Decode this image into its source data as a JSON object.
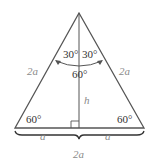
{
  "figure": {
    "type": "equilateral-triangle-with-altitude",
    "colors": {
      "stroke": "#555555",
      "dark_text": "#333333",
      "light_text": "#8a8a8a"
    },
    "labels": {
      "top_left_angle": "30°",
      "top_right_angle": "30°",
      "top_full_angle": "60°",
      "left_side": "2a",
      "right_side": "2a",
      "height": "h",
      "bottom_left_angle": "60°",
      "bottom_right_angle": "60°",
      "base_left_half": "a",
      "base_right_half": "a",
      "base_total": "2a"
    }
  }
}
